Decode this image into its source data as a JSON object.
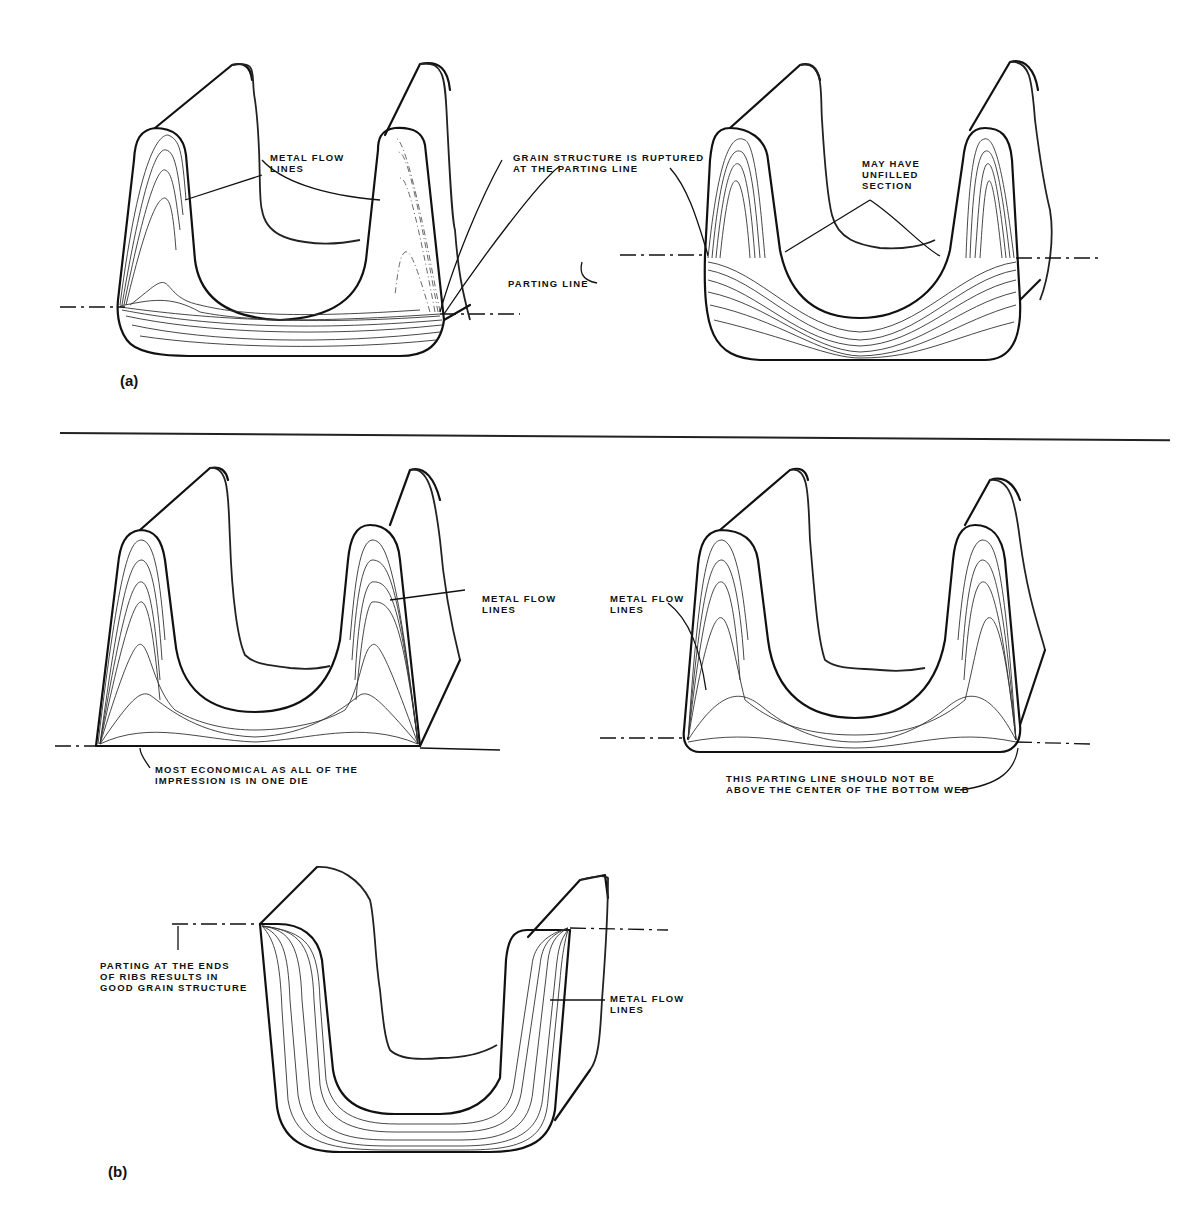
{
  "panels": {
    "a": {
      "label": "(a)",
      "left_figure": {
        "labels": {
          "metal_flow": "METAL FLOW\nLINES",
          "grain_ruptured": "GRAIN STRUCTURE IS RUPTURED\nAT THE PARTING LINE",
          "parting_line": "PARTING LINE"
        }
      },
      "right_figure": {
        "labels": {
          "unfilled": "MAY HAVE\nUNFILLED\nSECTION"
        }
      }
    },
    "b": {
      "label": "(b)",
      "figure_1": {
        "labels": {
          "metal_flow": "METAL FLOW\nLINES",
          "economical": "MOST ECONOMICAL AS ALL OF THE\nIMPRESSION IS IN ONE DIE"
        }
      },
      "figure_2": {
        "labels": {
          "metal_flow": "METAL FLOW\nLINES",
          "parting_note": "THIS PARTING LINE SHOULD NOT BE\nABOVE THE CENTER OF THE BOTTOM WEB"
        }
      },
      "figure_3": {
        "labels": {
          "parting_ends": "PARTING AT THE ENDS\nOF RIBS RESULTS IN\nGOOD GRAIN STRUCTURE",
          "metal_flow": "METAL FLOW\nLINES"
        }
      }
    }
  },
  "colors": {
    "ink": "#111111",
    "paper": "#ffffff"
  }
}
